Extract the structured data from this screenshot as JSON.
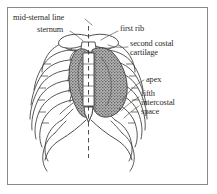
{
  "figure": {
    "kind": "anatomical-line-drawing",
    "frame": {
      "border_color": "#8a8a8a",
      "background_color": "#ffffff"
    },
    "ink_color": "#333333",
    "heart_fill_color": "#9d9d9d",
    "heart_stipple_color": "#5c5c5c",
    "text_color": "#2b2b2b"
  },
  "labels": [
    {
      "id": "mid-sternal-line",
      "text": "mid-sternal line",
      "x": 13,
      "y": 17
    },
    {
      "id": "sternum",
      "text": "sternum",
      "x": 37,
      "y": 29
    },
    {
      "id": "first-rib",
      "text": "first rib",
      "x": 120,
      "y": 28
    },
    {
      "id": "second-costal-cartilage-line1",
      "text": "second costal",
      "x": 130,
      "y": 43
    },
    {
      "id": "second-costal-cartilage-line2",
      "text": "cartilage",
      "x": 130,
      "y": 52
    },
    {
      "id": "apex",
      "text": "apex",
      "x": 146,
      "y": 79
    },
    {
      "id": "fifth-intercostal-space-line1",
      "text": "fifth",
      "x": 141,
      "y": 93
    },
    {
      "id": "fifth-intercostal-space-line2",
      "text": "intercostal",
      "x": 141,
      "y": 102
    },
    {
      "id": "fifth-intercostal-space-line3",
      "text": "space",
      "x": 141,
      "y": 111
    }
  ],
  "structures": [
    {
      "id": "mid-sternal-line-dashed",
      "name": "mid-sternal line (dashed vertical midline)"
    },
    {
      "id": "sternum",
      "name": "sternum (manubrium, body, xiphoid process)"
    },
    {
      "id": "first-rib",
      "name": "first rib"
    },
    {
      "id": "second-costal-cartilage",
      "name": "second costal cartilage"
    },
    {
      "id": "rib-cage-left",
      "name": "left ribs and costal cartilages"
    },
    {
      "id": "rib-cage-right",
      "name": "right ribs and costal cartilages"
    },
    {
      "id": "costal-margin",
      "name": "costal margin"
    },
    {
      "id": "heart-outline",
      "name": "heart silhouette (stippled)"
    },
    {
      "id": "heart-apex",
      "name": "apex of the heart"
    },
    {
      "id": "fifth-intercostal-space",
      "name": "fifth intercostal space"
    }
  ]
}
